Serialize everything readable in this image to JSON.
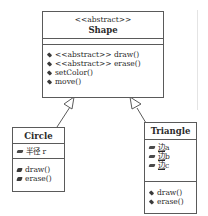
{
  "diagram": {
    "type": "uml-class-diagram",
    "classes": [
      {
        "id": "shape",
        "stereotype": "<<abstract>>",
        "name": "Shape",
        "attributes": [],
        "methods": [
          {
            "label": "<<abstract>> draw()"
          },
          {
            "label": "<<abstract>> erase()"
          },
          {
            "label": "setColor()"
          },
          {
            "label": "move()"
          }
        ]
      },
      {
        "id": "circle",
        "name": "Circle",
        "attributes": [
          {
            "label": "半径 r"
          }
        ],
        "methods": [
          {
            "label": "draw()"
          },
          {
            "label": "erase()"
          }
        ]
      },
      {
        "id": "triangle",
        "name": "Triangle",
        "attributes": [
          {
            "prefix": "边",
            "suffix": "a"
          },
          {
            "prefix": "边",
            "suffix": "b"
          },
          {
            "prefix": "边",
            "suffix": "c"
          }
        ],
        "methods": [
          {
            "label": "draw()"
          },
          {
            "label": "erase()"
          }
        ]
      }
    ],
    "relations": [
      {
        "type": "generalization",
        "from": "circle",
        "to": "shape"
      },
      {
        "type": "generalization",
        "from": "triangle",
        "to": "shape"
      }
    ],
    "colors": {
      "line": "#5a5a5a",
      "text": "#2a2a2a",
      "background": "#ffffff"
    }
  }
}
